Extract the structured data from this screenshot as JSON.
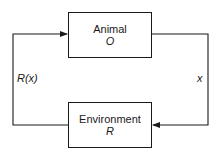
{
  "diagram": {
    "type": "feedback-loop",
    "nodes": {
      "animal": {
        "title": "Animal",
        "symbol": "O"
      },
      "environment": {
        "title": "Environment",
        "symbol": "R"
      }
    },
    "edges": {
      "animal_to_environment": {
        "label": "x"
      },
      "environment_to_animal": {
        "label": "R(x)"
      }
    },
    "colors": {
      "stroke": "#1a1a1a",
      "background": "#ffffff"
    }
  }
}
